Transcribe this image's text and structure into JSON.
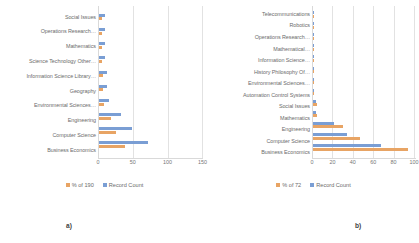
{
  "figure": {
    "panels": [
      {
        "caption": "a)",
        "chart_data": {
          "type": "bar",
          "orientation": "horizontal",
          "title": "",
          "xlabel": "",
          "ylabel": "",
          "xlim": [
            0,
            150
          ],
          "xticks": [
            0,
            50,
            100,
            150
          ],
          "grid": true,
          "legend_position": "bottom",
          "categories": [
            "Social Issues",
            "Operations Research…",
            "Mathematics",
            "Science Technology Other…",
            "Information Science Library…",
            "Geography",
            "Environmental Sciences…",
            "Engineering",
            "Computer Science",
            "Business Economics"
          ],
          "series": [
            {
              "name": "Record Count",
              "color": "#7a9ed4",
              "values": [
                8,
                8,
                8,
                9,
                12,
                12,
                14,
                32,
                48,
                71
              ]
            },
            {
              "name": "% of 190",
              "color": "#e8a464",
              "values": [
                4,
                4,
                4,
                5,
                6,
                6,
                7,
                17,
                25,
                37
              ]
            }
          ],
          "plotted_order": [
            "Record Count",
            "% of 190"
          ]
        },
        "legend": [
          {
            "label": "% of 190",
            "color": "#e8a464"
          },
          {
            "label": "Record Count",
            "color": "#7a9ed4"
          }
        ]
      },
      {
        "caption": "b)",
        "chart_data": {
          "type": "bar",
          "orientation": "horizontal",
          "title": "",
          "xlabel": "",
          "ylabel": "",
          "xlim": [
            0,
            100
          ],
          "xticks": [
            0,
            20,
            40,
            60,
            80,
            100
          ],
          "grid": true,
          "legend_position": "bottom",
          "categories": [
            "Telecommunications",
            "Robotics",
            "Operations Research…",
            "Mathematical…",
            "Information Science…",
            "History Philosophy Of…",
            "Environmental Sciences…",
            "Automation Control Systems",
            "Social Issues",
            "Mathematics",
            "Engineering",
            "Computer Science",
            "Business Economics"
          ],
          "series": [
            {
              "name": "Record Count",
              "color": "#7a9ed4",
              "values": [
                1,
                1,
                1,
                1,
                1,
                1,
                1,
                1,
                3,
                3,
                21,
                33,
                67
              ]
            },
            {
              "name": "% of 72",
              "color": "#e8a464",
              "values": [
                1,
                1,
                1,
                1,
                1,
                1,
                1,
                1,
                4,
                4,
                29,
                46,
                93
              ]
            }
          ],
          "plotted_order": [
            "Record Count",
            "% of 72"
          ]
        },
        "legend": [
          {
            "label": "% of 72",
            "color": "#e8a464"
          },
          {
            "label": "Record Count",
            "color": "#7a9ed4"
          }
        ]
      }
    ]
  }
}
